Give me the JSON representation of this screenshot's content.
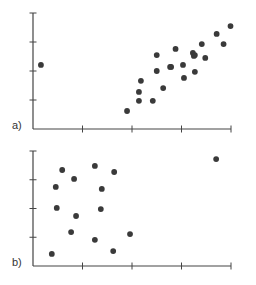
{
  "chart_data": [
    {
      "type": "scatter",
      "panel_label": "a)",
      "title": "",
      "xlabel": "",
      "ylabel": "",
      "xlim": [
        0,
        4
      ],
      "ylim": [
        0,
        4
      ],
      "x_ticks": 4,
      "y_ticks": 4,
      "tick_labels": false,
      "grid": false,
      "legend": null,
      "point_color": "#3a3a3a",
      "points": [
        {
          "x": 0.16,
          "y": 2.21
        },
        {
          "x": 1.9,
          "y": 0.62
        },
        {
          "x": 2.14,
          "y": 0.97
        },
        {
          "x": 2.42,
          "y": 0.97
        },
        {
          "x": 2.14,
          "y": 1.28
        },
        {
          "x": 2.63,
          "y": 1.41
        },
        {
          "x": 2.18,
          "y": 1.66
        },
        {
          "x": 2.5,
          "y": 2.0
        },
        {
          "x": 2.77,
          "y": 2.14
        },
        {
          "x": 2.5,
          "y": 2.55
        },
        {
          "x": 2.79,
          "y": 2.14
        },
        {
          "x": 3.03,
          "y": 2.21
        },
        {
          "x": 3.25,
          "y": 2.52
        },
        {
          "x": 2.88,
          "y": 2.76
        },
        {
          "x": 3.05,
          "y": 1.76
        },
        {
          "x": 3.23,
          "y": 2.62
        },
        {
          "x": 3.48,
          "y": 2.45
        },
        {
          "x": 3.41,
          "y": 2.93
        },
        {
          "x": 3.27,
          "y": 2.55
        },
        {
          "x": 3.27,
          "y": 1.97
        },
        {
          "x": 3.85,
          "y": 2.93
        },
        {
          "x": 3.71,
          "y": 3.28
        },
        {
          "x": 3.99,
          "y": 3.55
        }
      ]
    },
    {
      "type": "scatter",
      "panel_label": "b)",
      "title": "",
      "xlabel": "",
      "ylabel": "",
      "xlim": [
        0,
        4
      ],
      "ylim": [
        0,
        4
      ],
      "x_ticks": 4,
      "y_ticks": 4,
      "tick_labels": false,
      "grid": false,
      "legend": null,
      "point_color": "#3a3a3a",
      "points": [
        {
          "x": 0.59,
          "y": 3.34
        },
        {
          "x": 1.25,
          "y": 3.48
        },
        {
          "x": 1.64,
          "y": 3.27
        },
        {
          "x": 0.83,
          "y": 3.03
        },
        {
          "x": 0.46,
          "y": 2.75
        },
        {
          "x": 1.39,
          "y": 2.68
        },
        {
          "x": 0.48,
          "y": 2.02
        },
        {
          "x": 1.37,
          "y": 1.98
        },
        {
          "x": 0.87,
          "y": 1.74
        },
        {
          "x": 0.77,
          "y": 1.18
        },
        {
          "x": 1.25,
          "y": 0.91
        },
        {
          "x": 1.62,
          "y": 0.52
        },
        {
          "x": 0.38,
          "y": 0.42
        },
        {
          "x": 1.96,
          "y": 1.11
        },
        {
          "x": 3.7,
          "y": 3.72
        }
      ]
    }
  ]
}
